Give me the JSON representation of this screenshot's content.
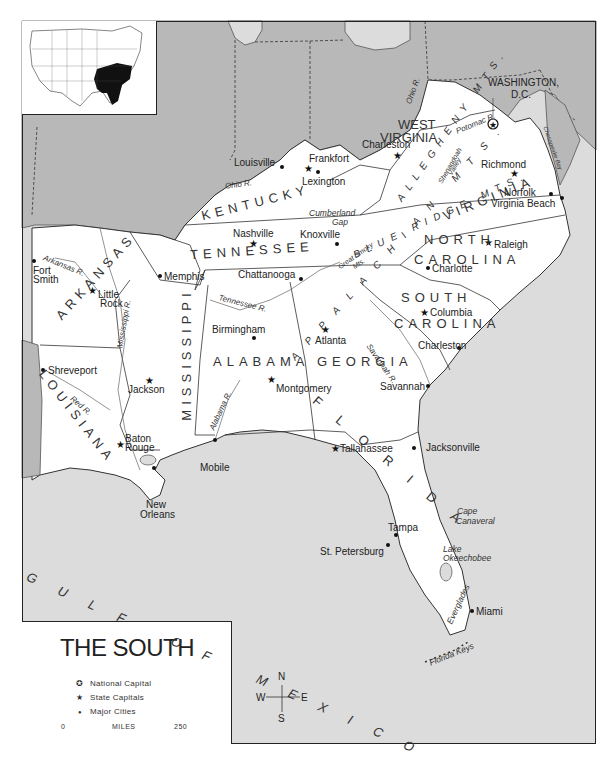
{
  "title": "THE SOUTH",
  "colors": {
    "land_south": "#ffffff",
    "land_other": "#b8b8b8",
    "water": "#dcdcdc",
    "highlight_inset": "#111111",
    "border": "#222222"
  },
  "inset": {
    "description": "Inset map of the contiguous United States with the southern states shaded black"
  },
  "legend": {
    "title": "THE SOUTH",
    "items": [
      {
        "symbol": "national-capital-icon",
        "glyph": "✪",
        "label": "National Capital"
      },
      {
        "symbol": "state-capital-icon",
        "glyph": "★",
        "label": "State Capitals"
      },
      {
        "symbol": "major-city-icon",
        "glyph": "●",
        "label": "Major Cities"
      }
    ],
    "scale": {
      "min": "0",
      "unit": "MILES",
      "max": "250"
    }
  },
  "compass": {
    "n": "N",
    "s": "S",
    "e": "E",
    "w": "W"
  },
  "states": [
    {
      "name": "KENTUCKY"
    },
    {
      "name": "TENNESSEE"
    },
    {
      "name": "ARKANSAS"
    },
    {
      "name": "LOUISIANA"
    },
    {
      "name": "MISSISSIPPI"
    },
    {
      "name": "ALABAMA"
    },
    {
      "name": "GEORGIA"
    },
    {
      "name": "FLORIDA"
    },
    {
      "name": "SOUTH"
    },
    {
      "name": "CAROLINA"
    },
    {
      "name": "NORTH"
    },
    {
      "name": "CAROLINA"
    },
    {
      "name": "VIRGINIA"
    },
    {
      "name": "WEST"
    },
    {
      "name": "VIRGINIA"
    }
  ],
  "national_capital": {
    "name": "WASHINGTON,",
    "name2": "D.C."
  },
  "state_capitals": [
    {
      "name": "Frankfort"
    },
    {
      "name": "Charleston"
    },
    {
      "name": "Richmond"
    },
    {
      "name": "Nashville"
    },
    {
      "name": "Raleigh"
    },
    {
      "name": "Little"
    },
    {
      "name": "Rock"
    },
    {
      "name": "Columbia"
    },
    {
      "name": "Atlanta"
    },
    {
      "name": "Jackson"
    },
    {
      "name": "Montgomery"
    },
    {
      "name": "Baton"
    },
    {
      "name": "Rouge"
    },
    {
      "name": "Tallahassee"
    }
  ],
  "major_cities": [
    {
      "name": "Louisville"
    },
    {
      "name": "Lexington"
    },
    {
      "name": "Knoxville"
    },
    {
      "name": "Norfolk"
    },
    {
      "name": "Virginia Beach"
    },
    {
      "name": "Memphis"
    },
    {
      "name": "Chattanooga"
    },
    {
      "name": "Charlotte"
    },
    {
      "name": "Fort"
    },
    {
      "name": "Smith"
    },
    {
      "name": "Birmingham"
    },
    {
      "name": "Charleston"
    },
    {
      "name": "Savannah"
    },
    {
      "name": "Shreveport"
    },
    {
      "name": "Jacksonville"
    },
    {
      "name": "Mobile"
    },
    {
      "name": "New"
    },
    {
      "name": "Orleans"
    },
    {
      "name": "Tampa"
    },
    {
      "name": "St. Petersburg"
    },
    {
      "name": "Miami"
    }
  ],
  "rivers": [
    {
      "name": "Ohio R."
    },
    {
      "name": "Ohio R."
    },
    {
      "name": "Arkansas R."
    },
    {
      "name": "Mississippi R."
    },
    {
      "name": "Tennessee R."
    },
    {
      "name": "Red R."
    },
    {
      "name": "Alabama R."
    },
    {
      "name": "Savannah R."
    },
    {
      "name": "Potomac R."
    },
    {
      "name": "Chesapeake Bay"
    }
  ],
  "features": [
    {
      "name": "Cumberland"
    },
    {
      "name": "Gap"
    },
    {
      "name": "Great Smoky"
    },
    {
      "name": "Mts."
    },
    {
      "name": "Shenandoah"
    },
    {
      "name": "Valley"
    },
    {
      "name": "Cape"
    },
    {
      "name": "Canaveral"
    },
    {
      "name": "Lake"
    },
    {
      "name": "Okeechobee"
    },
    {
      "name": "Everglades"
    },
    {
      "name": "Florida Keys"
    }
  ],
  "mountains": [
    {
      "name": "APPALACHIAN MTS."
    },
    {
      "name": "ALLEGHENY MTS."
    },
    {
      "name": "BLUE RIDGE MTS."
    }
  ],
  "water_bodies": [
    {
      "name": "GULF OF MEXICO"
    },
    {
      "name": "ATLANTIC OCEAN"
    }
  ]
}
